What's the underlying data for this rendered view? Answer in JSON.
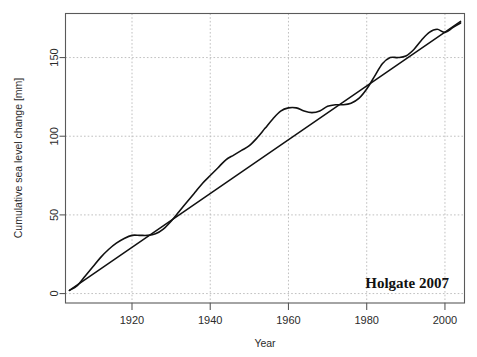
{
  "chart_data": {
    "type": "line",
    "title": "",
    "subtitle": "",
    "xlabel": "Year",
    "ylabel": "Cumulative sea level change [mm]",
    "xlim": [
      1903,
      2005
    ],
    "ylim": [
      -6,
      178
    ],
    "xticks": [
      1920,
      1940,
      1960,
      1980,
      2000
    ],
    "xtick_labels": [
      "1920",
      "1940",
      "1960",
      "1980",
      "2000"
    ],
    "yticks": [
      0,
      50,
      100,
      150
    ],
    "ytick_labels": [
      "0",
      "50",
      "100",
      "150"
    ],
    "grid": true,
    "legend_position": "none",
    "annotations": [
      {
        "text": "Holgate 2007",
        "x": 1985,
        "y": 8
      }
    ],
    "series": [
      {
        "name": "Cumulative sea level change",
        "type": "line",
        "color": "#111111",
        "x": [
          1904,
          1906,
          1908,
          1910,
          1912,
          1914,
          1916,
          1918,
          1920,
          1922,
          1924,
          1926,
          1928,
          1930,
          1932,
          1934,
          1936,
          1938,
          1940,
          1942,
          1944,
          1946,
          1948,
          1950,
          1952,
          1954,
          1956,
          1958,
          1960,
          1962,
          1964,
          1966,
          1968,
          1970,
          1972,
          1974,
          1976,
          1978,
          1980,
          1982,
          1984,
          1986,
          1988,
          1990,
          1992,
          1994,
          1996,
          1998,
          2000,
          2002,
          2004
        ],
        "y": [
          2,
          5,
          11,
          17,
          23,
          28,
          32,
          35,
          37,
          37,
          37,
          38,
          41,
          46,
          52,
          58,
          64,
          70,
          75,
          80,
          85,
          88,
          91,
          94,
          99,
          105,
          111,
          116,
          118,
          118,
          116,
          115,
          116,
          119,
          120,
          120,
          121,
          124,
          130,
          138,
          146,
          150,
          150,
          151,
          155,
          161,
          166,
          168,
          166,
          169,
          172
        ]
      },
      {
        "name": "Linear trend",
        "type": "line",
        "color": "#111111",
        "x": [
          1904,
          2004
        ],
        "y": [
          2,
          173
        ]
      }
    ]
  },
  "axes": {
    "y_axis_title": "Cumulative sea level change [mm]",
    "x_axis_title": "Year"
  },
  "annotation": {
    "source_label": "Holgate 2007"
  }
}
